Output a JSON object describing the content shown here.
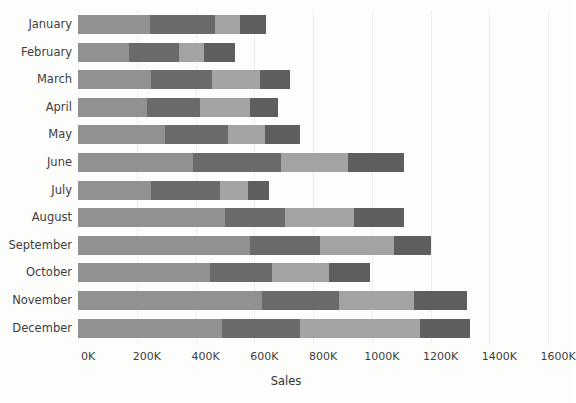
{
  "chart_data": {
    "type": "bar",
    "orientation": "horizontal",
    "stacked": true,
    "title": "",
    "subtitle": "",
    "xlabel": "Sales",
    "ylabel": "",
    "xlim": [
      0,
      1600
    ],
    "xunit": "K",
    "xtick_labels": [
      "0K",
      "200K",
      "400K",
      "600K",
      "800K",
      "1000K",
      "1200K",
      "1400K",
      "1600K"
    ],
    "xtick_values": [
      0,
      200,
      400,
      600,
      800,
      1000,
      1200,
      1400,
      1600
    ],
    "grid": false,
    "legend": "none",
    "categories": [
      "January",
      "February",
      "March",
      "April",
      "May",
      "June",
      "July",
      "August",
      "September",
      "October",
      "November",
      "December"
    ],
    "series": [
      {
        "name": "Segment 1",
        "color": "#919191",
        "values": [
          245,
          175,
          250,
          235,
          295,
          390,
          250,
          500,
          585,
          450,
          625,
          490
        ]
      },
      {
        "name": "Segment 2",
        "color": "#6a6a6a",
        "values": [
          220,
          170,
          205,
          180,
          215,
          300,
          232,
          205,
          240,
          210,
          265,
          265
        ]
      },
      {
        "name": "Segment 3",
        "color": "#a3a3a3",
        "values": [
          85,
          85,
          165,
          170,
          125,
          230,
          96,
          235,
          250,
          195,
          255,
          408
        ]
      },
      {
        "name": "Segment 4",
        "color": "#5e5e5e",
        "values": [
          90,
          105,
          100,
          95,
          120,
          190,
          72,
          170,
          125,
          140,
          180,
          170
        ]
      }
    ],
    "totals": [
      640,
      535,
      720,
      680,
      755,
      1110,
      650,
      1110,
      1200,
      995,
      1325,
      1333
    ]
  },
  "style": {
    "background": "#fdfdfc",
    "text_color": "#3d3d3d",
    "gridline_color": "#f0efee"
  }
}
